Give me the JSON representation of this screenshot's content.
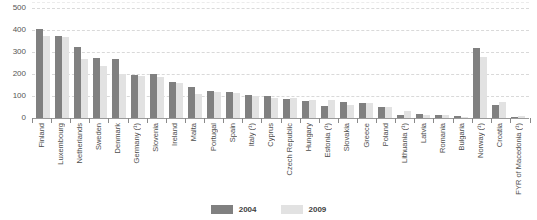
{
  "chart_data": {
    "type": "bar",
    "title": "",
    "subtitle": "",
    "xlabel": "",
    "ylabel": "",
    "ylim": [
      0,
      500
    ],
    "yticks": [
      0,
      100,
      200,
      300,
      400,
      500
    ],
    "ytick_labels": [
      "0",
      "100",
      "200",
      "300",
      "400",
      "500"
    ],
    "grid": true,
    "legend_position": "bottom-center",
    "categories": [
      "Finland",
      "Luxembourg",
      "Netherlands",
      "Sweden",
      "Denmark",
      "Germany (¹)",
      "Slovenia",
      "Ireland",
      "Malta",
      "Portugal",
      "Spain",
      "Italy (¹)",
      "Cyprus",
      "Czech Republic",
      "Hungary",
      "Estonia (¹)",
      "Slovakia",
      "Greece",
      "Poland",
      "Lithuania (¹)",
      "Latvia",
      "Romania",
      "Bulgaria",
      "Norway (¹)",
      "Croatia",
      "FYR of Macedonia (¹)"
    ],
    "series": [
      {
        "name": "2004",
        "color": "#808080",
        "values": [
          405,
          372,
          325,
          272,
          270,
          196,
          200,
          165,
          140,
          125,
          118,
          105,
          98,
          88,
          78,
          55,
          72,
          68,
          48,
          15,
          20,
          14,
          8,
          320,
          58,
          5
        ]
      },
      {
        "name": "2009",
        "color": "#e2e2e2",
        "values": [
          375,
          370,
          268,
          236,
          200,
          192,
          186,
          160,
          108,
          120,
          113,
          100,
          90,
          92,
          82,
          84,
          60,
          70,
          52,
          30,
          14,
          12,
          6,
          278,
          75,
          8
        ]
      }
    ]
  },
  "legend": {
    "items": [
      {
        "label": "2004",
        "color": "#808080"
      },
      {
        "label": "2009",
        "color": "#e2e2e2"
      }
    ]
  }
}
